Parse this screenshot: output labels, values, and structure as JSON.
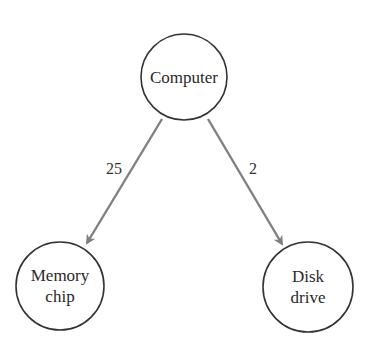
{
  "diagram": {
    "nodes": [
      {
        "id": "computer",
        "lines": [
          "Computer"
        ]
      },
      {
        "id": "memory-chip",
        "lines": [
          "Memory",
          "chip"
        ]
      },
      {
        "id": "disk-drive",
        "lines": [
          "Disk",
          "drive"
        ]
      }
    ],
    "edges": [
      {
        "from": "computer",
        "to": "memory-chip",
        "label": "25"
      },
      {
        "from": "computer",
        "to": "disk-drive",
        "label": "2"
      }
    ],
    "colors": {
      "edge": "#808080",
      "node_stroke": "#333333"
    }
  }
}
